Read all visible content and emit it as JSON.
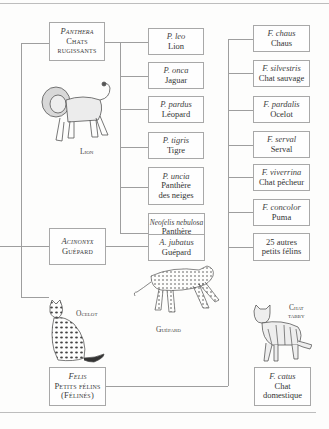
{
  "genera": {
    "panthera": {
      "scientific": "Panthera",
      "line2": "Chats",
      "line3": "rugissants"
    },
    "acinonyx": {
      "scientific": "Acinonyx",
      "line2": "Guépard"
    },
    "felis": {
      "scientific": "Felis",
      "line2": "Petits félins",
      "line3": "(Félinés)"
    }
  },
  "panthera_species": [
    {
      "scientific": "P. leo",
      "common": "Lion"
    },
    {
      "scientific": "P. onca",
      "common": "Jaguar"
    },
    {
      "scientific": "P. pardus",
      "common": "Léopard"
    },
    {
      "scientific": "P. tigris",
      "common": "Tigre"
    },
    {
      "scientific": "P. uncia",
      "common": "Panthère",
      "common2": "des neiges"
    },
    {
      "scientific": "Neofelis nebulosa",
      "common": "Panthère",
      "common2": "nébuleuse"
    }
  ],
  "acinonyx_species": [
    {
      "scientific": "A. jubatus",
      "common": "Guépard"
    }
  ],
  "felis_species": [
    {
      "scientific": "F. chaus",
      "common": "Chaus"
    },
    {
      "scientific": "F. silvestris",
      "common": "Chat sauvage"
    },
    {
      "scientific": "F. pardalis",
      "common": "Ocelot"
    },
    {
      "scientific": "F. serval",
      "common": "Serval"
    },
    {
      "scientific": "F. viverrina",
      "common": "Chat pêcheur"
    },
    {
      "scientific": "F. concolor",
      "common": "Puma"
    },
    {
      "scientific": "",
      "common": "25 autres",
      "common2": "petits félins"
    },
    {
      "scientific": "F. catus",
      "common": "Chat",
      "common2": "domestique"
    }
  ],
  "illustrations": {
    "lion": "Lion",
    "cheetah": "Guépard",
    "ocelot": "Ocelot",
    "tabby_line1": "Chat",
    "tabby_line2": "tabby"
  }
}
